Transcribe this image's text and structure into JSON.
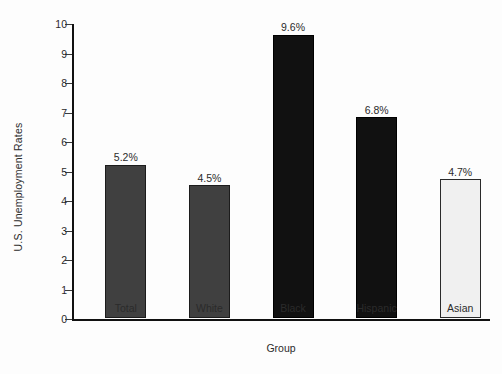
{
  "chart_data": {
    "type": "bar",
    "title": "",
    "xlabel": "Group",
    "ylabel": "U.S. Unemployment Rates",
    "categories": [
      "Total",
      "White",
      "Black",
      "Hispanic",
      "Asian"
    ],
    "values": [
      5.2,
      4.5,
      9.6,
      6.8,
      4.7
    ],
    "value_labels": [
      "5.2%",
      "4.5%",
      "9.6%",
      "6.8%",
      "4.7%"
    ],
    "ylim": [
      0,
      10
    ],
    "yticks": [
      0,
      1,
      2,
      3,
      4,
      5,
      6,
      7,
      8,
      9,
      10
    ],
    "ytick_labels": [
      "0",
      "1",
      "2",
      "3",
      "4",
      "5",
      "6",
      "7",
      "8",
      "9",
      "10"
    ],
    "grid": false,
    "legend": "none",
    "bar_colors": [
      "#404040",
      "#404040",
      "#111111",
      "#111111",
      "#f0f0f0"
    ],
    "bar_edge_colors": [
      "#1c1c1c",
      "#1c1c1c",
      "#000000",
      "#000000",
      "#2a2a2a"
    ]
  }
}
